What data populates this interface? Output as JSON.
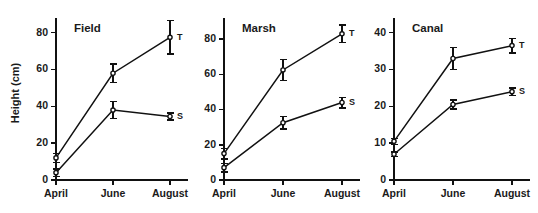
{
  "figure": {
    "ylabel": "Height (cm)",
    "background": "#ffffff",
    "ink_color": "#111111"
  },
  "chart_data": [
    {
      "type": "line",
      "title": "Field",
      "xlabel": "",
      "ylabel": "Height (cm)",
      "categories": [
        "April",
        "June",
        "August"
      ],
      "xticklabels": [
        "April",
        "June",
        "August"
      ],
      "yticks": [
        0,
        20,
        40,
        60,
        80
      ],
      "yticklabels": [
        "0",
        "20",
        "40",
        "60",
        "80"
      ],
      "ylim": [
        0,
        88
      ],
      "grid": false,
      "legend": "inline-right-of-last-point",
      "series": [
        {
          "name": "T",
          "label": "T",
          "values": [
            12,
            58,
            77.5
          ],
          "errors": [
            2.5,
            5,
            9
          ]
        },
        {
          "name": "S",
          "label": "S",
          "values": [
            4,
            38,
            34.5
          ],
          "errors": [
            2,
            4.5,
            2
          ]
        }
      ]
    },
    {
      "type": "line",
      "title": "Marsh",
      "xlabel": "",
      "ylabel": "",
      "categories": [
        "April",
        "June",
        "August"
      ],
      "xticklabels": [
        "April",
        "June",
        "August"
      ],
      "yticks": [
        0,
        20,
        40,
        60,
        80
      ],
      "yticklabels": [
        "0",
        "20",
        "40",
        "60",
        "80"
      ],
      "ylim": [
        0,
        92
      ],
      "grid": false,
      "legend": "inline-right-of-last-point",
      "series": [
        {
          "name": "T",
          "label": "T",
          "values": [
            15,
            62.5,
            83
          ],
          "errors": [
            3,
            6,
            5
          ]
        },
        {
          "name": "S",
          "label": "S",
          "values": [
            7,
            32.5,
            44
          ],
          "errors": [
            2.5,
            3.5,
            3
          ]
        }
      ]
    },
    {
      "type": "line",
      "title": "Canal",
      "xlabel": "",
      "ylabel": "",
      "categories": [
        "April",
        "June",
        "August"
      ],
      "xticklabels": [
        "April",
        "June",
        "August"
      ],
      "yticks": [
        0,
        10,
        20,
        30,
        40
      ],
      "yticklabels": [
        "0",
        "10",
        "20",
        "30",
        "40"
      ],
      "ylim": [
        0,
        44
      ],
      "grid": false,
      "legend": "inline-right-of-last-point",
      "series": [
        {
          "name": "T",
          "label": "T",
          "values": [
            10.5,
            33,
            36.5
          ],
          "errors": [
            0.8,
            3,
            2
          ]
        },
        {
          "name": "S",
          "label": "S",
          "values": [
            7,
            20.5,
            24
          ],
          "errors": [
            0.6,
            1.2,
            1
          ]
        }
      ]
    }
  ]
}
